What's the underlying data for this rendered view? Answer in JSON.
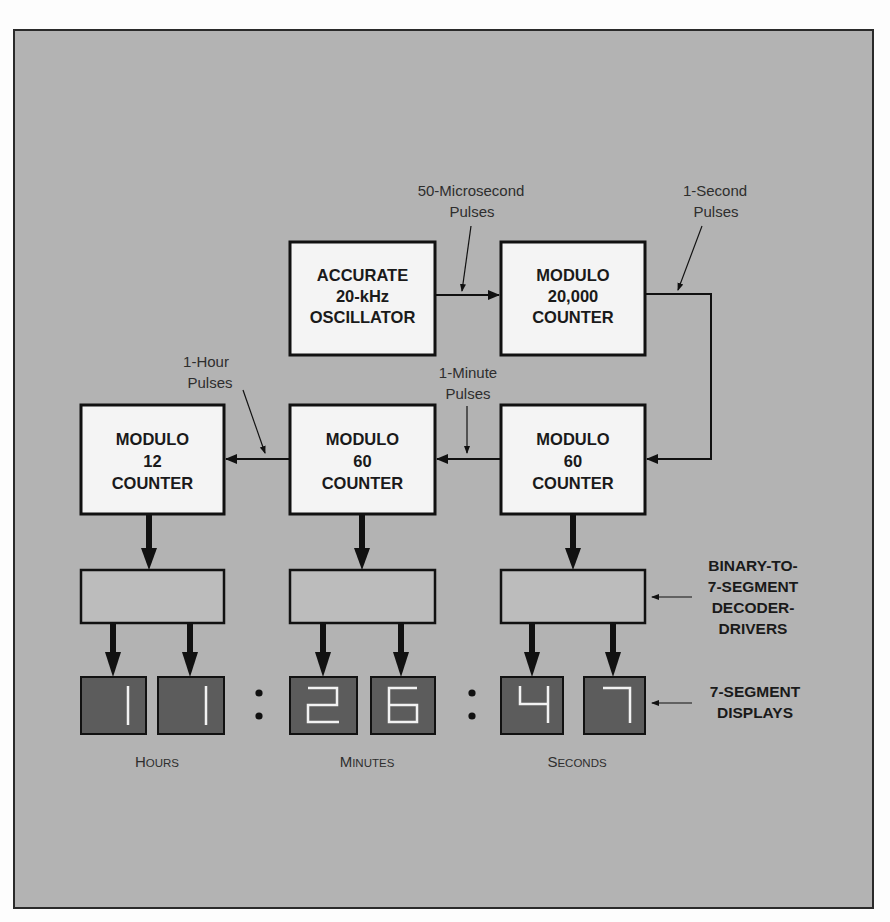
{
  "diagram": {
    "title_visible": false,
    "colors": {
      "frame_bg": "#b3b3b3",
      "frame_border": "#2a2a2a",
      "block_fill": "#f4f4f4",
      "decoder_fill": "#bcbcbc",
      "display_fill": "#5c5c5c",
      "segment": "#f2f2f2",
      "line": "#111111"
    },
    "blocks": {
      "oscillator": {
        "lines": [
          "ACCURATE",
          "20-kHz",
          "OSCILLATOR"
        ]
      },
      "mod20000": {
        "lines": [
          "MODULO",
          "20,000",
          "COUNTER"
        ]
      },
      "mod60_seconds": {
        "lines": [
          "MODULO",
          "60",
          "COUNTER"
        ]
      },
      "mod60_minutes": {
        "lines": [
          "MODULO",
          "60",
          "COUNTER"
        ]
      },
      "mod12_hours": {
        "lines": [
          "MODULO",
          "12",
          "COUNTER"
        ]
      }
    },
    "pulse_labels": {
      "microsecond": [
        "50-Microsecond",
        "Pulses"
      ],
      "second": [
        "1-Second",
        "Pulses"
      ],
      "minute": [
        "1-Minute",
        "Pulses"
      ],
      "hour": [
        "1-Hour",
        "Pulses"
      ]
    },
    "side_labels": {
      "decoders": [
        "BINARY-TO-",
        "7-SEGMENT",
        "DECODER-",
        "DRIVERS"
      ],
      "displays": [
        "7-SEGMENT",
        "DISPLAYS"
      ]
    },
    "display": {
      "digits": [
        "1",
        "1",
        "2",
        "6",
        "4",
        "7"
      ],
      "time_text": "11:26:47",
      "separator": ":"
    },
    "group_captions": {
      "hours": {
        "first": "H",
        "rest": "OURS"
      },
      "minutes": {
        "first": "M",
        "rest": "INUTES"
      },
      "seconds": {
        "first": "S",
        "rest": "ECONDS"
      }
    }
  }
}
